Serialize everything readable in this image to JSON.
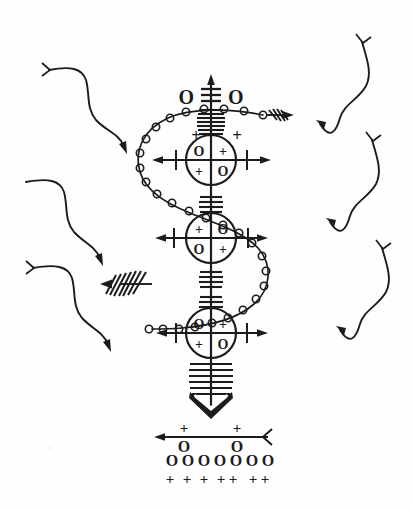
{
  "figure": {
    "background_color": "#fefefe",
    "ink_color": "#1c1c1c",
    "width": 412,
    "height": 509
  },
  "top_label": {
    "left_glyph": "O",
    "right_glyph": "O",
    "center_icon": "triple-bar-icon"
  },
  "nodes": [
    {
      "id": "node-1",
      "cx": 211,
      "cy": 160,
      "r": 25,
      "quadrants": {
        "top_left": "O",
        "top_right": "+",
        "bottom_left": "+",
        "bottom_right": "O"
      },
      "flank_left": "+",
      "flank_right": "+",
      "has_horizontal_arrow": true
    },
    {
      "id": "node-2",
      "cx": 211,
      "cy": 238,
      "r": 25,
      "quadrants": {
        "top_left": "+",
        "top_right": "O",
        "bottom_left": "O",
        "bottom_right": "+"
      },
      "flank_left": "",
      "flank_right": "",
      "has_horizontal_arrow": true
    },
    {
      "id": "node-3",
      "cx": 211,
      "cy": 333,
      "r": 25,
      "quadrants": {
        "top_left": "O",
        "top_right": "+",
        "bottom_left": "+",
        "bottom_right": "O"
      },
      "flank_left": "",
      "flank_right": "",
      "has_horizontal_arrow": true
    }
  ],
  "arrows": {
    "vertical_up": "up-arrow-icon",
    "vertical_down_fletched": "fletched-down-arrow-icon",
    "top_right_fletched": "fletched-right-arrow-icon",
    "mid_left_fletched": "fletched-left-arrow-icon"
  },
  "beaded_path": {
    "label": "s-curve-beaded-chain",
    "bead_count": 34,
    "bead_radius": 3.6
  },
  "footer": {
    "line_label": "footer-axis-line",
    "top_marks": [
      "+",
      "+"
    ],
    "bottom_marks": [
      "O",
      "O"
    ],
    "row_circles": [
      "O",
      "O",
      "O",
      "O",
      "O",
      "O",
      "O"
    ],
    "row_pluses": [
      "+",
      "+",
      "+",
      "+",
      "+",
      "+",
      "+"
    ]
  },
  "squiggles": {
    "left": [
      {
        "id": "squiggle-left-1",
        "start": "nock",
        "end": "arrowhead"
      },
      {
        "id": "squiggle-left-2",
        "start": "plain",
        "end": "arrowhead"
      },
      {
        "id": "squiggle-left-3",
        "start": "nock",
        "end": "arrowhead"
      }
    ],
    "right": [
      {
        "id": "squiggle-right-1",
        "start": "nock",
        "end": "arrowhead"
      },
      {
        "id": "squiggle-right-2",
        "start": "nock",
        "end": "arrowhead"
      },
      {
        "id": "squiggle-right-3",
        "start": "nock",
        "end": "arrowhead"
      }
    ]
  }
}
